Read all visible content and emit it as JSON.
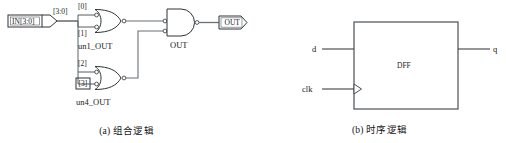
{
  "figure": {
    "type": "digital-logic-schematic",
    "panels": [
      {
        "id": "a",
        "caption": "(a) 组合逻辑",
        "input_port": {
          "label": "IN[3:0]",
          "shape": "bus-input-pin"
        },
        "bus_label": "[3:0]",
        "bit_taps": [
          {
            "label": "[0]",
            "boxed": false
          },
          {
            "label": "[1]",
            "boxed": false
          },
          {
            "label": "[2]",
            "boxed": false
          },
          {
            "label": "[3]",
            "boxed": true
          }
        ],
        "gates": [
          {
            "name": "un1_OUT",
            "type": "nor",
            "inputs": [
              "[0]",
              "[1]"
            ],
            "instance_label": "un1_OUT"
          },
          {
            "name": "un4_OUT",
            "type": "nor",
            "inputs": [
              "[2]",
              "[3]"
            ],
            "instance_label": "un4_OUT"
          },
          {
            "name": "OUT",
            "type": "and",
            "inputs": [
              "un1_OUT",
              "un4_OUT"
            ],
            "instance_label": "OUT"
          }
        ],
        "output_port": {
          "label": "OUT",
          "shape": "output-pin"
        }
      },
      {
        "id": "b",
        "caption": "(b) 时序逻辑",
        "block": {
          "label": "DFF",
          "shape": "rectangle"
        },
        "inputs": [
          {
            "label": "d",
            "clock": false
          },
          {
            "label": "clk",
            "clock": true
          }
        ],
        "outputs": [
          {
            "label": "q"
          }
        ]
      }
    ]
  },
  "colors": {
    "background": "#ffffff",
    "line": "#3d4348",
    "line_dark": "#2a2f33",
    "text": "#1b1b1b",
    "wire": "#5a6268"
  }
}
